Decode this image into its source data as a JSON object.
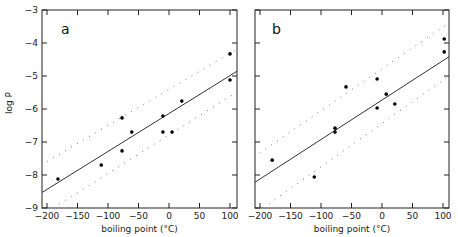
{
  "chart_data": [
    {
      "type": "scatter",
      "panel_label": "a",
      "title": "",
      "xlabel": "boiling point (°C)",
      "ylabel": "log P",
      "xlim": [
        -210,
        112
      ],
      "ylim": [
        -9,
        -3
      ],
      "xticks": [
        -200,
        -150,
        -100,
        -50,
        0,
        50,
        100
      ],
      "yticks": [
        -9,
        -8,
        -7,
        -6,
        -5,
        -4,
        -3
      ],
      "grid": false,
      "points": [
        {
          "x": -182,
          "y": -8.12
        },
        {
          "x": -111,
          "y": -7.7
        },
        {
          "x": -77,
          "y": -6.27
        },
        {
          "x": -77,
          "y": -7.27
        },
        {
          "x": -61,
          "y": -6.7
        },
        {
          "x": -10,
          "y": -6.21
        },
        {
          "x": -10,
          "y": -6.7
        },
        {
          "x": 5,
          "y": -6.7
        },
        {
          "x": 21,
          "y": -5.76
        },
        {
          "x": 100,
          "y": -4.33
        },
        {
          "x": 100,
          "y": -5.12
        }
      ],
      "fit_line": {
        "x": [
          -210,
          112
        ],
        "y": [
          -8.55,
          -4.85
        ]
      },
      "band_upper": {
        "x": [
          -210,
          112
        ],
        "y": [
          -7.7,
          -4.18
        ]
      },
      "band_lower": {
        "x": [
          -190,
          112
        ],
        "y": [
          -9.0,
          -5.48
        ]
      }
    },
    {
      "type": "scatter",
      "panel_label": "b",
      "title": "",
      "xlabel": "boiling point (°C)",
      "ylabel": "",
      "xlim": [
        -210,
        112
      ],
      "ylim": [
        -9,
        -3
      ],
      "xticks": [
        -200,
        -150,
        -100,
        -50,
        0,
        50,
        100
      ],
      "yticks": [
        -9,
        -8,
        -7,
        -6,
        -5,
        -4,
        -3
      ],
      "grid": false,
      "points": [
        {
          "x": -180,
          "y": -7.55
        },
        {
          "x": -111,
          "y": -8.06
        },
        {
          "x": -77,
          "y": -6.58
        },
        {
          "x": -77,
          "y": -6.7
        },
        {
          "x": -59,
          "y": -5.33
        },
        {
          "x": -8,
          "y": -5.09
        },
        {
          "x": -8,
          "y": -5.97
        },
        {
          "x": 7,
          "y": -5.55
        },
        {
          "x": 21,
          "y": -5.85
        },
        {
          "x": 102,
          "y": -3.88
        },
        {
          "x": 102,
          "y": -4.27
        }
      ],
      "fit_line": {
        "x": [
          -210,
          112
        ],
        "y": [
          -8.24,
          -4.39
        ]
      },
      "band_upper": {
        "x": [
          -210,
          112
        ],
        "y": [
          -7.45,
          -3.36
        ]
      },
      "band_lower": {
        "x": [
          -195,
          112
        ],
        "y": [
          -9.0,
          -4.97
        ]
      }
    }
  ],
  "panels": [
    {
      "label": "a",
      "xlabel": "boiling point (°C)",
      "ylabel": "log P"
    },
    {
      "label": "b",
      "xlabel": "boiling point (°C)",
      "ylabel": ""
    }
  ]
}
